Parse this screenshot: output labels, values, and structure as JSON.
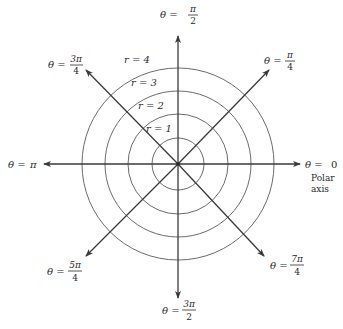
{
  "diagram": {
    "type": "polar-coordinate-grid",
    "center": {
      "x": 178,
      "y": 164
    },
    "colors": {
      "circle": "#6a6a6a",
      "axis": "#3a3a3a",
      "text": "#2a2a2a",
      "background": "#ffffff"
    },
    "circles": [
      {
        "r_value": 1,
        "label": "r = 1",
        "radius_px": 26
      },
      {
        "r_value": 2,
        "label": "r = 2",
        "radius_px": 50
      },
      {
        "r_value": 3,
        "label": "r = 3",
        "radius_px": 73
      },
      {
        "r_value": 4,
        "label": "r = 4",
        "radius_px": 96
      }
    ],
    "rays": [
      {
        "angle": "0",
        "label_prefix": "θ = ",
        "num": "0",
        "den": "",
        "extra_lines": [
          "Polar",
          "axis"
        ]
      },
      {
        "angle": "π/4",
        "label_prefix": "θ = ",
        "num": "π",
        "den": "4"
      },
      {
        "angle": "π/2",
        "label_prefix": "θ = ",
        "num": "π",
        "den": "2"
      },
      {
        "angle": "3π/4",
        "label_prefix": "θ = ",
        "num": "3π",
        "den": "4"
      },
      {
        "angle": "π",
        "label_prefix": "θ = ",
        "num": "π",
        "den": ""
      },
      {
        "angle": "5π/4",
        "label_prefix": "θ = ",
        "num": "5π",
        "den": "4"
      },
      {
        "angle": "3π/2",
        "label_prefix": "θ = ",
        "num": "3π",
        "den": "2"
      },
      {
        "angle": "7π/4",
        "label_prefix": "θ = ",
        "num": "7π",
        "den": "4"
      }
    ]
  }
}
